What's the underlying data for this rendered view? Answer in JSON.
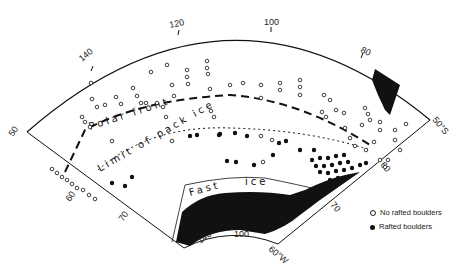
{
  "map": {
    "title": "",
    "graticule": {
      "outer_arc_longitude_labels": [
        "140",
        "120",
        "100",
        "80"
      ],
      "inner_arc_longitude_labels": [
        "140",
        "100",
        "60°W"
      ],
      "left_edge_latitude_labels": [
        "50",
        "60",
        "70"
      ],
      "right_edge_latitude_labels": [
        "50°S",
        "60",
        "70"
      ]
    },
    "features": {
      "polar_front_label": "Polar front",
      "pack_ice_label": "Limit of pack ice",
      "fast_ice_label_1": "Fast",
      "fast_ice_label_2": "ice"
    },
    "legend": {
      "items": [
        {
          "symbol": "open-circle",
          "label": "No rafted boulders"
        },
        {
          "symbol": "filled-circle",
          "label": "Rafted boulders"
        }
      ]
    },
    "colors": {
      "ink": "#111111",
      "background": "#ffffff"
    }
  }
}
